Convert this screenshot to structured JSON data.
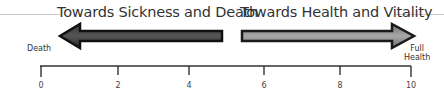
{
  "diagram": {
    "left_title": "Towards Sickness and Death",
    "right_title": "Towards Health and Vitality",
    "left_end_label": "Death",
    "right_end_label_line1": "Full",
    "right_end_label_line2": "Health",
    "axis": {
      "min": 0,
      "max": 10,
      "ticks": [
        "0",
        "2",
        "4",
        "6",
        "8",
        "10"
      ]
    },
    "colors": {
      "left_arrow_fill": "#2a2a2a",
      "left_arrow_border": "#111111",
      "right_arrow_fill": "#8a8a8a",
      "right_arrow_border": "#1a1a1a",
      "axis_line": "#333333"
    }
  }
}
